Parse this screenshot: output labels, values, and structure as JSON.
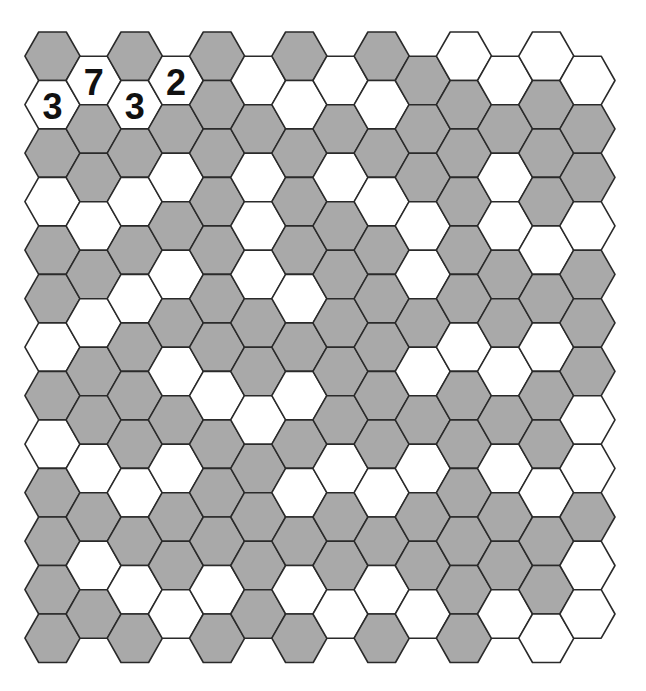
{
  "puzzle": {
    "type": "hexagonal-grid-puzzle",
    "columns": 14,
    "rows_even_columns": 13,
    "rows_odd_columns": 12,
    "orientation": "flat-top, odd columns shifted down half a cell",
    "colors": {
      "shaded": "#a9a9a9",
      "unshaded": "#ffffff",
      "outline": "#2a2a2a",
      "clue_text": "#111111"
    },
    "legend": {
      "G": "shaded cell",
      "W": "white cell"
    },
    "grid_columns": [
      [
        "G",
        "W",
        "G",
        "W",
        "G",
        "G",
        "W",
        "G",
        "W",
        "G",
        "G",
        "G",
        "G"
      ],
      [
        "W",
        "G",
        "G",
        "W",
        "G",
        "W",
        "G",
        "G",
        "W",
        "G",
        "W",
        "G"
      ],
      [
        "G",
        "W",
        "G",
        "W",
        "G",
        "W",
        "G",
        "G",
        "G",
        "W",
        "G",
        "W",
        "G"
      ],
      [
        "W",
        "G",
        "W",
        "G",
        "W",
        "G",
        "W",
        "G",
        "W",
        "G",
        "G",
        "W"
      ],
      [
        "G",
        "G",
        "G",
        "G",
        "G",
        "G",
        "G",
        "W",
        "G",
        "G",
        "G",
        "W",
        "G"
      ],
      [
        "W",
        "G",
        "W",
        "W",
        "W",
        "G",
        "G",
        "W",
        "G",
        "G",
        "G",
        "G"
      ],
      [
        "G",
        "W",
        "G",
        "G",
        "G",
        "W",
        "G",
        "W",
        "G",
        "W",
        "G",
        "W",
        "G"
      ],
      [
        "W",
        "G",
        "W",
        "G",
        "G",
        "G",
        "G",
        "G",
        "W",
        "G",
        "G",
        "W"
      ],
      [
        "G",
        "W",
        "G",
        "W",
        "G",
        "G",
        "G",
        "G",
        "G",
        "W",
        "G",
        "W",
        "G"
      ],
      [
        "G",
        "G",
        "G",
        "W",
        "W",
        "G",
        "W",
        "G",
        "W",
        "G",
        "G",
        "W"
      ],
      [
        "W",
        "G",
        "G",
        "G",
        "G",
        "G",
        "W",
        "G",
        "G",
        "G",
        "G",
        "G",
        "G"
      ],
      [
        "W",
        "G",
        "W",
        "W",
        "G",
        "G",
        "W",
        "G",
        "W",
        "G",
        "G",
        "W"
      ],
      [
        "W",
        "G",
        "G",
        "G",
        "W",
        "G",
        "W",
        "G",
        "G",
        "W",
        "G",
        "G",
        "W"
      ],
      [
        "W",
        "G",
        "G",
        "W",
        "G",
        "G",
        "G",
        "W",
        "W",
        "G",
        "W",
        "W"
      ]
    ],
    "clues": [
      {
        "col": 0,
        "row": 1,
        "value": "3"
      },
      {
        "col": 1,
        "row": 0,
        "value": "7"
      },
      {
        "col": 2,
        "row": 1,
        "value": "3"
      },
      {
        "col": 3,
        "row": 0,
        "value": "2"
      }
    ]
  }
}
